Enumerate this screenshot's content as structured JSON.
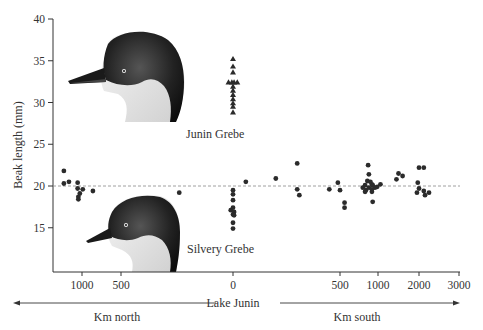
{
  "chart_data": {
    "type": "scatter",
    "title": "",
    "xlabel_center": "Lake Junin",
    "xlabel_left": "Km north",
    "xlabel_right": "Km south",
    "ylabel": "Beak length (mm)",
    "ylim": [
      11,
      40
    ],
    "y_ticks": [
      15,
      20,
      25,
      30,
      35,
      40
    ],
    "x_ticks": [
      {
        "label": "1000",
        "km": -1000
      },
      {
        "label": "500",
        "km": -500
      },
      {
        "label": "0",
        "km": 0
      },
      {
        "label": "500",
        "km": 500
      },
      {
        "label": "1000",
        "km": 1000
      },
      {
        "label": "2000",
        "km": 2000
      },
      {
        "label": "3000",
        "km": 3000
      }
    ],
    "x_scale": "piecewise (distance from Lake Junin; north negative, south positive)",
    "reference_line": {
      "y": 20,
      "style": "dashed"
    },
    "grid": false,
    "legend": "none (species labelled in-plot)",
    "series": [
      {
        "name": "Junin Grebe",
        "marker": "triangle",
        "points": [
          {
            "km": 0,
            "y": 35.2
          },
          {
            "km": 0,
            "y": 34.3
          },
          {
            "km": 0,
            "y": 33.6
          },
          {
            "km": -20,
            "y": 32.4
          },
          {
            "km": -5,
            "y": 32.4
          },
          {
            "km": 5,
            "y": 32.4
          },
          {
            "km": 20,
            "y": 32.4
          },
          {
            "km": 0,
            "y": 31.9
          },
          {
            "km": 0,
            "y": 31.4
          },
          {
            "km": 0,
            "y": 30.9
          },
          {
            "km": 0,
            "y": 30.4
          },
          {
            "km": 0,
            "y": 29.9
          },
          {
            "km": 0,
            "y": 29.5
          },
          {
            "km": 0,
            "y": 28.8
          }
        ]
      },
      {
        "name": "Silvery Grebe",
        "marker": "circle",
        "points": [
          {
            "km": -1250,
            "y": 21.8
          },
          {
            "km": -1250,
            "y": 20.3
          },
          {
            "km": -1180,
            "y": 20.5
          },
          {
            "km": -1060,
            "y": 20.4
          },
          {
            "km": -1060,
            "y": 19.7
          },
          {
            "km": -1030,
            "y": 19.1
          },
          {
            "km": -1050,
            "y": 18.7
          },
          {
            "km": -1050,
            "y": 18.4
          },
          {
            "km": -990,
            "y": 19.6
          },
          {
            "km": -860,
            "y": 19.4
          },
          {
            "km": -240,
            "y": 19.2
          },
          {
            "km": 0,
            "y": 19.5
          },
          {
            "km": 0,
            "y": 19.0
          },
          {
            "km": 0,
            "y": 18.3
          },
          {
            "km": 0,
            "y": 17.4
          },
          {
            "km": -10,
            "y": 17.1
          },
          {
            "km": 5,
            "y": 16.9
          },
          {
            "km": 0,
            "y": 16.6
          },
          {
            "km": 5,
            "y": 16.5
          },
          {
            "km": 0,
            "y": 15.6
          },
          {
            "km": 0,
            "y": 14.9
          },
          {
            "km": 60,
            "y": 20.5
          },
          {
            "km": 200,
            "y": 20.9
          },
          {
            "km": 300,
            "y": 22.7
          },
          {
            "km": 300,
            "y": 19.6
          },
          {
            "km": 310,
            "y": 18.9
          },
          {
            "km": 490,
            "y": 20.4
          },
          {
            "km": 450,
            "y": 19.6
          },
          {
            "km": 500,
            "y": 19.5
          },
          {
            "km": 560,
            "y": 18.0
          },
          {
            "km": 560,
            "y": 17.4
          },
          {
            "km": 870,
            "y": 22.5
          },
          {
            "km": 880,
            "y": 21.4
          },
          {
            "km": 860,
            "y": 20.6
          },
          {
            "km": 900,
            "y": 20.5
          },
          {
            "km": 920,
            "y": 20.2
          },
          {
            "km": 930,
            "y": 20.1
          },
          {
            "km": 830,
            "y": 20.1
          },
          {
            "km": 800,
            "y": 19.8
          },
          {
            "km": 840,
            "y": 19.5
          },
          {
            "km": 880,
            "y": 19.8
          },
          {
            "km": 920,
            "y": 19.6
          },
          {
            "km": 960,
            "y": 19.8
          },
          {
            "km": 990,
            "y": 19.9
          },
          {
            "km": 830,
            "y": 19.3
          },
          {
            "km": 920,
            "y": 19.3
          },
          {
            "km": 1060,
            "y": 20.2
          },
          {
            "km": 930,
            "y": 18.1
          },
          {
            "km": 1450,
            "y": 20.8
          },
          {
            "km": 1500,
            "y": 21.5
          },
          {
            "km": 1600,
            "y": 21.2
          },
          {
            "km": 2000,
            "y": 22.2
          },
          {
            "km": 2120,
            "y": 22.2
          },
          {
            "km": 1970,
            "y": 20.4
          },
          {
            "km": 2000,
            "y": 19.7
          },
          {
            "km": 1950,
            "y": 19.2
          },
          {
            "km": 2120,
            "y": 19.4
          },
          {
            "km": 2250,
            "y": 19.2
          },
          {
            "km": 2150,
            "y": 18.9
          }
        ]
      }
    ],
    "annotations": [
      {
        "text": "Junin Grebe",
        "near": "triangle cluster, below"
      },
      {
        "text": "Silvery Grebe",
        "near": "bottom center"
      }
    ]
  },
  "labels": {
    "ylabel": "Beak length (mm)",
    "lake": "Lake Junin",
    "north": "Km north",
    "south": "Km south",
    "junin": "Junin Grebe",
    "silvery": "Silvery Grebe"
  }
}
